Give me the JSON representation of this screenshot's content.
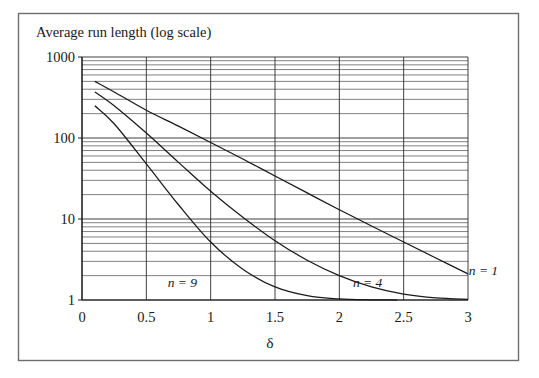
{
  "figure": {
    "background": "#ffffff",
    "frame_color": "#6e6e6e",
    "axis_color": "#1a1a1a",
    "grid_color": "#4a4a4a",
    "curve_color": "#1a1a1a"
  },
  "chart_data": {
    "type": "line",
    "title": "",
    "ylabel": "Average run length (log scale)",
    "xlabel": "δ",
    "yscale": "log",
    "xscale": "linear",
    "xlim": [
      0,
      3
    ],
    "ylim": [
      1,
      1000
    ],
    "xticks": [
      "0",
      "0.5",
      "1",
      "1.5",
      "2",
      "2.5",
      "3"
    ],
    "xtick_values": [
      0,
      0.5,
      1,
      1.5,
      2,
      2.5,
      3
    ],
    "yticks": [
      "1",
      "10",
      "100",
      "1000"
    ],
    "ytick_values": [
      1,
      10,
      100,
      1000
    ],
    "grid": "major and minor horizontal log gridlines; major vertical gridlines at each 0.5",
    "legend": "inline curve labels",
    "annotations": [
      {
        "text": "n = 9",
        "x": 0.78,
        "y": 1.45
      },
      {
        "text": "n = 4",
        "x": 2.22,
        "y": 1.45
      },
      {
        "text": "n = 1",
        "x": 3.12,
        "y": 2.05
      }
    ],
    "series": [
      {
        "name": "n = 1",
        "label": "n = 1",
        "x": [
          0.1,
          0.25,
          0.5,
          0.75,
          1.0,
          1.25,
          1.5,
          1.75,
          2.0,
          2.25,
          2.5,
          2.75,
          3.0
        ],
        "y": [
          500,
          370,
          220,
          140,
          88,
          55,
          34,
          21,
          13.0,
          8.2,
          5.2,
          3.3,
          2.1
        ]
      },
      {
        "name": "n = 4",
        "label": "n = 4",
        "x": [
          0.1,
          0.25,
          0.5,
          0.75,
          1.0,
          1.25,
          1.5,
          1.75,
          2.0,
          2.25,
          2.5,
          2.75,
          3.0
        ],
        "y": [
          370,
          250,
          115,
          50,
          22.0,
          10.5,
          5.4,
          3.1,
          2.0,
          1.45,
          1.18,
          1.06,
          1.02
        ]
      },
      {
        "name": "n = 9",
        "label": "n = 9",
        "x": [
          0.1,
          0.25,
          0.5,
          0.75,
          1.0,
          1.25,
          1.5,
          1.75,
          2.0,
          2.25,
          2.45
        ],
        "y": [
          250,
          150,
          48,
          15.0,
          5.2,
          2.4,
          1.45,
          1.13,
          1.03,
          1.005,
          1.0
        ]
      }
    ]
  }
}
